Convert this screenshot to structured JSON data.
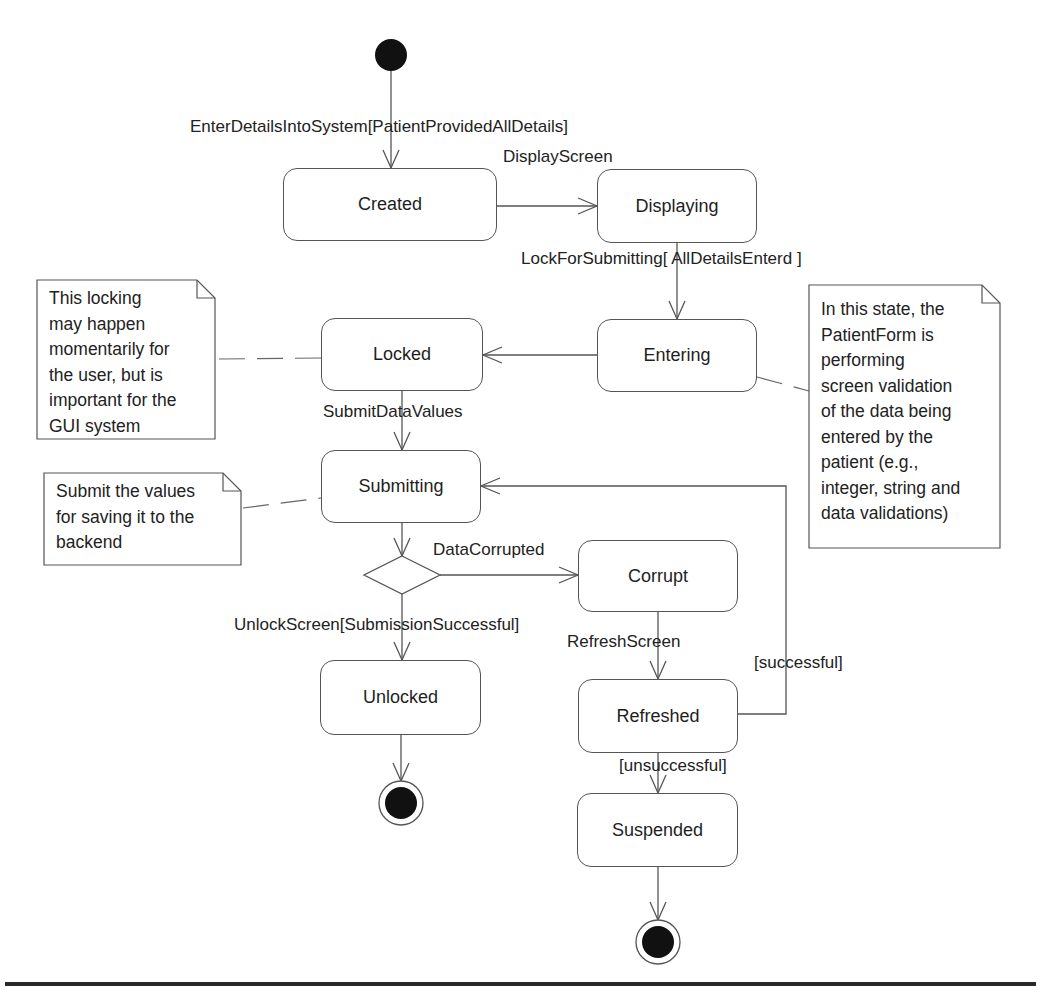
{
  "diagram": {
    "type": "UML state machine",
    "subject": "PatientForm",
    "colors": {
      "stroke": "#555555",
      "node_fill": "#111111",
      "text": "#1e1e1e",
      "background": "#ffffff"
    },
    "states": [
      {
        "id": "created",
        "label": "Created"
      },
      {
        "id": "displaying",
        "label": "Displaying"
      },
      {
        "id": "entering",
        "label": "Entering"
      },
      {
        "id": "locked",
        "label": "Locked"
      },
      {
        "id": "submitting",
        "label": "Submitting"
      },
      {
        "id": "corrupt",
        "label": "Corrupt"
      },
      {
        "id": "unlocked",
        "label": "Unlocked"
      },
      {
        "id": "refreshed",
        "label": "Refreshed"
      },
      {
        "id": "suspended",
        "label": "Suspended"
      }
    ],
    "transitions": [
      {
        "from": "initial",
        "to": "created",
        "label": "EnterDetailsIntoSystem[PatientProvidedAllDetails]"
      },
      {
        "from": "created",
        "to": "displaying",
        "label": "DisplayScreen"
      },
      {
        "from": "displaying",
        "to": "entering",
        "label": "LockForSubmitting[ AllDetailsEnterd ]"
      },
      {
        "from": "entering",
        "to": "locked",
        "label": ""
      },
      {
        "from": "locked",
        "to": "submitting",
        "label": "SubmitDataValues"
      },
      {
        "from": "submitting",
        "to": "decision",
        "label": ""
      },
      {
        "from": "decision",
        "to": "corrupt",
        "label": "DataCorrupted"
      },
      {
        "from": "decision",
        "to": "unlocked",
        "label": "UnlockScreen[SubmissionSuccessful]"
      },
      {
        "from": "corrupt",
        "to": "refreshed",
        "label": "RefreshScreen"
      },
      {
        "from": "refreshed",
        "to": "submitting",
        "label": "[successful]"
      },
      {
        "from": "refreshed",
        "to": "suspended",
        "label": "[unsuccessful]"
      },
      {
        "from": "unlocked",
        "to": "final",
        "label": ""
      },
      {
        "from": "suspended",
        "to": "final",
        "label": ""
      }
    ],
    "notes": [
      {
        "id": "locking-note",
        "attached_to": "locked",
        "text": "This locking\nmay happen\nmomentarily for\nthe user, but is\nimportant for the\nGUI system"
      },
      {
        "id": "submit-note",
        "attached_to": "submitting",
        "text": "Submit the values\nfor saving it to the\nbackend"
      },
      {
        "id": "entering-note",
        "attached_to": "entering",
        "text": "In this state, the\nPatientForm is\nperforming\nscreen validation\nof the data being\nentered by the\npatient (e.g.,\ninteger, string and\ndata validations)"
      }
    ]
  }
}
